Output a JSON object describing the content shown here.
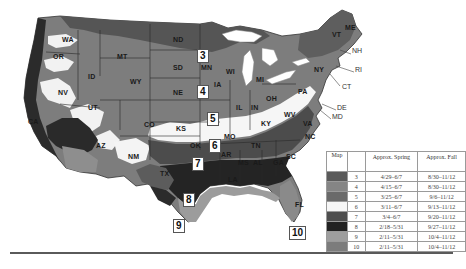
{
  "map": {
    "title": "US planting zone map with approximate spring and fall planting dates",
    "zone_colors": {
      "3": "#5a5a5a",
      "4": "#858585",
      "5": "#6e6e6e",
      "6": "#f4f4f4",
      "7": "#4a4a4a",
      "8": "#262626",
      "9": "#9a9a9a",
      "10": "#7a7a7a"
    },
    "zone_markers": [
      {
        "label": "3",
        "x": 197,
        "y": 49
      },
      {
        "label": "4",
        "x": 197,
        "y": 85
      },
      {
        "label": "5",
        "x": 207,
        "y": 112
      },
      {
        "label": "6",
        "x": 209,
        "y": 139
      },
      {
        "label": "7",
        "x": 192,
        "y": 157
      },
      {
        "label": "8",
        "x": 183,
        "y": 193
      },
      {
        "label": "9",
        "x": 173,
        "y": 219
      },
      {
        "label": "10",
        "x": 289,
        "y": 226
      }
    ],
    "state_labels": [
      {
        "code": "WA",
        "x": 62,
        "y": 40
      },
      {
        "code": "OR",
        "x": 53,
        "y": 57
      },
      {
        "code": "MT",
        "x": 117,
        "y": 57
      },
      {
        "code": "ID",
        "x": 88,
        "y": 77
      },
      {
        "code": "ND",
        "x": 173,
        "y": 40
      },
      {
        "code": "SD",
        "x": 173,
        "y": 68
      },
      {
        "code": "MN",
        "x": 201,
        "y": 68
      },
      {
        "code": "WY",
        "x": 130,
        "y": 82
      },
      {
        "code": "WI",
        "x": 226,
        "y": 72
      },
      {
        "code": "MI",
        "x": 256,
        "y": 80
      },
      {
        "code": "NE",
        "x": 173,
        "y": 93
      },
      {
        "code": "IA",
        "x": 214,
        "y": 85
      },
      {
        "code": "NV",
        "x": 58,
        "y": 93
      },
      {
        "code": "UT",
        "x": 88,
        "y": 108
      },
      {
        "code": "CO",
        "x": 144,
        "y": 125
      },
      {
        "code": "IL",
        "x": 236,
        "y": 108
      },
      {
        "code": "IN",
        "x": 251,
        "y": 108
      },
      {
        "code": "OH",
        "x": 266,
        "y": 99
      },
      {
        "code": "PA",
        "x": 298,
        "y": 92
      },
      {
        "code": "CA",
        "x": 28,
        "y": 122
      },
      {
        "code": "KS",
        "x": 176,
        "y": 129
      },
      {
        "code": "MO",
        "x": 224,
        "y": 137
      },
      {
        "code": "KY",
        "x": 261,
        "y": 124
      },
      {
        "code": "WV",
        "x": 284,
        "y": 115
      },
      {
        "code": "VA",
        "x": 303,
        "y": 124
      },
      {
        "code": "NC",
        "x": 305,
        "y": 137
      },
      {
        "code": "AZ",
        "x": 96,
        "y": 146
      },
      {
        "code": "NM",
        "x": 128,
        "y": 157
      },
      {
        "code": "OK",
        "x": 190,
        "y": 146
      },
      {
        "code": "TN",
        "x": 251,
        "y": 146
      },
      {
        "code": "SC",
        "x": 286,
        "y": 157
      },
      {
        "code": "AR",
        "x": 221,
        "y": 155
      },
      {
        "code": "MS",
        "x": 238,
        "y": 163
      },
      {
        "code": "AL",
        "x": 253,
        "y": 163
      },
      {
        "code": "GA",
        "x": 273,
        "y": 163
      },
      {
        "code": "TX",
        "x": 160,
        "y": 174
      },
      {
        "code": "LA",
        "x": 228,
        "y": 180
      },
      {
        "code": "FL",
        "x": 295,
        "y": 205
      },
      {
        "code": "VT",
        "x": 332,
        "y": 35
      },
      {
        "code": "ME",
        "x": 345,
        "y": 28
      },
      {
        "code": "NY",
        "x": 314,
        "y": 70
      }
    ],
    "callouts": [
      {
        "code": "NH",
        "x": 352,
        "y": 51
      },
      {
        "code": "RI",
        "x": 355,
        "y": 70
      },
      {
        "code": "CT",
        "x": 342,
        "y": 87
      },
      {
        "code": "DE",
        "x": 337,
        "y": 108
      },
      {
        "code": "MD",
        "x": 332,
        "y": 117
      }
    ]
  },
  "legend": {
    "headers": {
      "map": "Map",
      "zone": "",
      "spring": "Approx. Spring",
      "fall": "Approx. Fall"
    },
    "rows": [
      {
        "zone": "3",
        "spring": "4/29–6/7",
        "fall": "8/30–11/12",
        "color": "#5a5a5a"
      },
      {
        "zone": "4",
        "spring": "4/15–6/7",
        "fall": "8/30–11/12",
        "color": "#858585"
      },
      {
        "zone": "5",
        "spring": "3/25–6/7",
        "fall": "9/6–11/12",
        "color": "#6a6a6a"
      },
      {
        "zone": "6",
        "spring": "3/11–6/7",
        "fall": "9/13–11/12",
        "color": "#f6f6f6"
      },
      {
        "zone": "7",
        "spring": "3/4–6/7",
        "fall": "9/20–11/12",
        "color": "#4e4e4e"
      },
      {
        "zone": "8",
        "spring": "2/18–5/31",
        "fall": "9/27–11/12",
        "color": "#222222"
      },
      {
        "zone": "9",
        "spring": "2/11–5/31",
        "fall": "10/4–11/12",
        "color": "#9e9e9e"
      },
      {
        "zone": "10",
        "spring": "2/11–5/31",
        "fall": "10/4–11/12",
        "color": "#7c7c7c"
      }
    ]
  }
}
